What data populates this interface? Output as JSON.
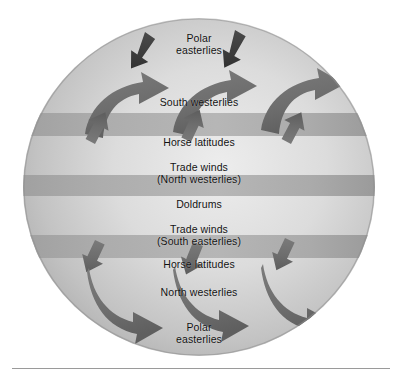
{
  "figure": {
    "type": "diagram",
    "shape": "sphere",
    "palette": {
      "light_surface": "#e2e2e2",
      "mid_surface": "#bdbdbd",
      "dark_surface": "#9c9c9c",
      "band_fill": "#a7a7a7",
      "arrow_fill": "#6f6f6f",
      "arrow_dark": "#3f3f3f",
      "text": "#111111",
      "rule": "#9a9a9a",
      "background": "#ffffff"
    }
  },
  "zones": [
    {
      "id": "polar-easterlies-north",
      "label": "Polar\neasterlies",
      "y": 14,
      "kind": "label"
    },
    {
      "id": "south-westerlies",
      "label": "South      westerlies",
      "y": 78,
      "kind": "label"
    },
    {
      "id": "horse-latitudes-north",
      "label": "Horse latitudes",
      "y": 118,
      "kind": "band"
    },
    {
      "id": "trade-winds-north",
      "label": "Trade winds\n(North westerlies)",
      "y": 143,
      "kind": "label"
    },
    {
      "id": "doldrums",
      "label": "Doldrums",
      "y": 180,
      "kind": "band"
    },
    {
      "id": "trade-winds-south",
      "label": "Trade winds\n(South easterlies)",
      "y": 205,
      "kind": "label"
    },
    {
      "id": "horse-latitudes-south",
      "label": "Horse latitudes",
      "y": 240,
      "kind": "band"
    },
    {
      "id": "north-westerlies",
      "label": "North      westerlies",
      "y": 268,
      "kind": "label"
    },
    {
      "id": "polar-easterlies-south",
      "label": "Polar\neasterlies",
      "y": 303,
      "kind": "label"
    }
  ],
  "bands": [
    {
      "id": "band-horse-north",
      "top": 113,
      "height": 23
    },
    {
      "id": "band-doldrums",
      "top": 175,
      "height": 21
    },
    {
      "id": "band-horse-south",
      "top": 235,
      "height": 23
    }
  ],
  "arrows": [
    {
      "id": "arrow-polar-ne-1",
      "zone": "polar-easterlies-north",
      "direction": "down-left",
      "size": "small"
    },
    {
      "id": "arrow-polar-ne-2",
      "zone": "polar-easterlies-north",
      "direction": "down-left",
      "size": "small"
    },
    {
      "id": "arrow-sw-1",
      "zone": "south-westerlies",
      "direction": "up-right",
      "size": "large"
    },
    {
      "id": "arrow-sw-2",
      "zone": "south-westerlies",
      "direction": "up-right",
      "size": "large"
    },
    {
      "id": "arrow-sw-3",
      "zone": "south-westerlies",
      "direction": "up-right",
      "size": "large"
    },
    {
      "id": "arrow-tn-1",
      "zone": "trade-winds-north",
      "direction": "down-left",
      "size": "small"
    },
    {
      "id": "arrow-tn-2",
      "zone": "trade-winds-north",
      "direction": "down-left",
      "size": "small"
    },
    {
      "id": "arrow-tn-3",
      "zone": "trade-winds-north",
      "direction": "down-left",
      "size": "small"
    },
    {
      "id": "arrow-ts-1",
      "zone": "trade-winds-south",
      "direction": "up-left",
      "size": "small"
    },
    {
      "id": "arrow-ts-2",
      "zone": "trade-winds-south",
      "direction": "up-left",
      "size": "small"
    },
    {
      "id": "arrow-ts-3",
      "zone": "trade-winds-south",
      "direction": "up-left",
      "size": "small"
    },
    {
      "id": "arrow-nw-1",
      "zone": "north-westerlies",
      "direction": "down-right",
      "size": "large"
    },
    {
      "id": "arrow-nw-2",
      "zone": "north-westerlies",
      "direction": "down-right",
      "size": "large"
    },
    {
      "id": "arrow-nw-3",
      "zone": "north-westerlies",
      "direction": "down-right",
      "size": "large"
    },
    {
      "id": "arrow-polar-se-1",
      "zone": "polar-easterlies-south",
      "direction": "up-left",
      "size": "small"
    },
    {
      "id": "arrow-polar-se-2",
      "zone": "polar-easterlies-south",
      "direction": "up-left",
      "size": "small"
    }
  ]
}
